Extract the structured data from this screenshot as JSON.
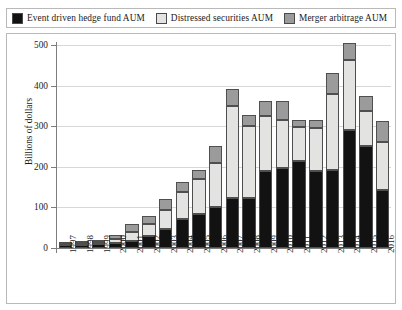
{
  "legend": {
    "entries": [
      {
        "label": "Event driven hedge fund AUM",
        "swatch": "#121212",
        "name": "legend-event-driven"
      },
      {
        "label": "Distressed securities AUM",
        "swatch": "#e3e3e1",
        "name": "legend-distressed"
      },
      {
        "label": "Merger arbitrage AUM",
        "swatch": "#9b9b9b",
        "name": "legend-merger-arbitrage"
      }
    ]
  },
  "axes": {
    "y_title": "Billions of dollars",
    "y_ticks": [
      "500",
      "400",
      "300",
      "200",
      "100",
      "0"
    ],
    "x_ticks": [
      "1997",
      "1998",
      "1999",
      "2000",
      "2001",
      "2002",
      "2003",
      "2004",
      "2005",
      "2006",
      "2007",
      "2008",
      "2009",
      "2010",
      "2011",
      "2012",
      "2013",
      "2014",
      "2015",
      "2016"
    ]
  },
  "chart_data": {
    "type": "bar",
    "stacked": true,
    "title": "",
    "xlabel": "",
    "ylabel": "Billions of dollars",
    "ylim": [
      0,
      500
    ],
    "grid": true,
    "legend_position": "top",
    "categories": [
      "1997",
      "1998",
      "1999",
      "2000",
      "2001",
      "2002",
      "2003",
      "2004",
      "2005",
      "2006",
      "2007",
      "2008",
      "2009",
      "2010",
      "2011",
      "2012",
      "2013",
      "2014",
      "2015",
      "2016"
    ],
    "series": [
      {
        "name": "Event driven hedge fund AUM",
        "color": "#121212",
        "values": [
          7,
          8,
          9,
          12,
          18,
          30,
          47,
          72,
          85,
          100,
          122,
          122,
          190,
          196,
          215,
          190,
          192,
          290,
          252,
          142
        ]
      },
      {
        "name": "Distressed securities AUM",
        "color": "#e3e3e1",
        "values": [
          4,
          5,
          6,
          10,
          22,
          28,
          47,
          66,
          85,
          110,
          228,
          178,
          135,
          120,
          82,
          106,
          188,
          173,
          85,
          118
        ]
      },
      {
        "name": "Merger arbitrage AUM",
        "color": "#9b9b9b",
        "values": [
          4,
          5,
          6,
          10,
          18,
          22,
          26,
          24,
          22,
          42,
          42,
          28,
          37,
          45,
          18,
          20,
          50,
          42,
          38,
          53
        ]
      }
    ],
    "totals": [
      15,
      18,
      21,
      32,
      58,
      80,
      120,
      162,
      192,
      252,
      392,
      328,
      362,
      361,
      315,
      316,
      430,
      505,
      375,
      313
    ]
  }
}
